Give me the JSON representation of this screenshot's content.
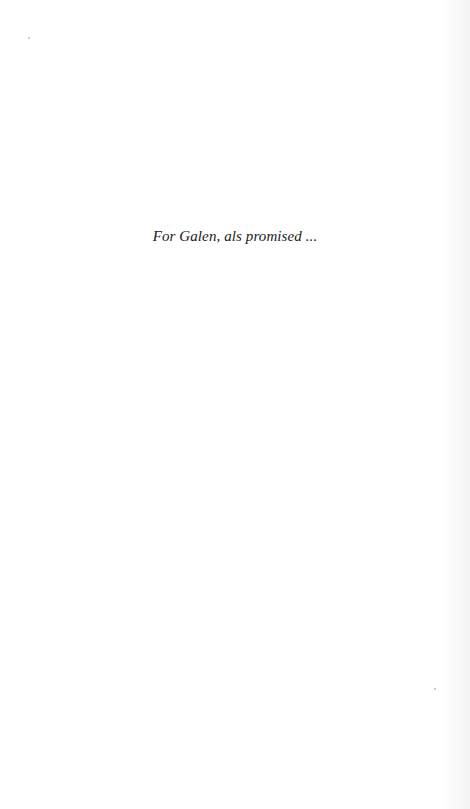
{
  "page": {
    "background": "#ffffff",
    "dedication": "For Galen, als promised ..."
  }
}
